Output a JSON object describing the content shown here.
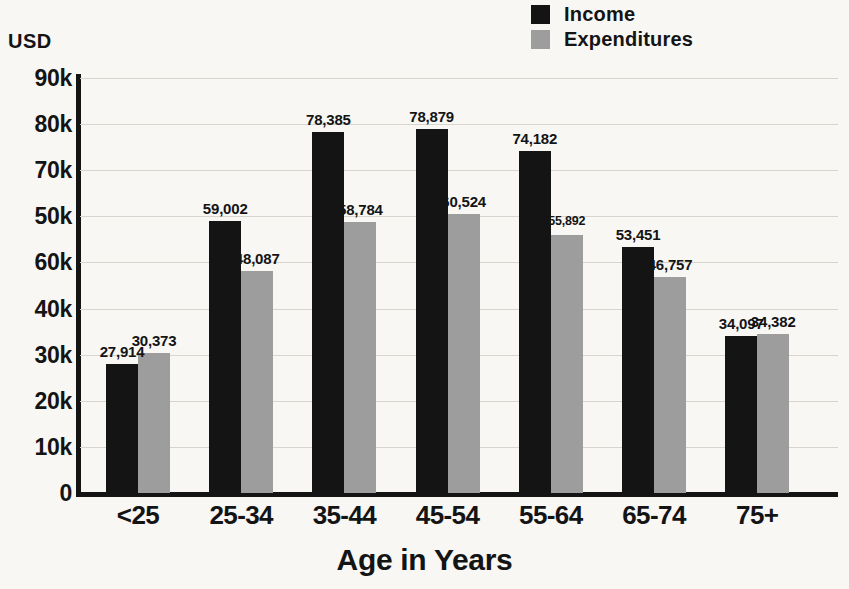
{
  "chart_data": {
    "type": "bar",
    "title": "",
    "xlabel": "Age in Years",
    "ylabel": "USD",
    "categories": [
      "<25",
      "25-34",
      "35-44",
      "45-54",
      "55-64",
      "65-74",
      "75+"
    ],
    "series": [
      {
        "name": "Income",
        "color": "#141414",
        "values": [
          27914,
          59002,
          78385,
          78879,
          74182,
          53451,
          34097
        ],
        "labels": [
          "27,914",
          "59,002",
          "78,385",
          "78,879",
          "74,182",
          "53,451",
          "34,097"
        ]
      },
      {
        "name": "Expenditures",
        "color": "#9d9d9d",
        "values": [
          30373,
          48087,
          58784,
          60524,
          55892,
          46757,
          34382
        ],
        "labels": [
          "30,373",
          "48,087",
          "58,784",
          "60,524",
          "55,892",
          "46,757",
          "34,382"
        ]
      }
    ],
    "ylim": [
      0,
      90000
    ],
    "y_tick_labels": [
      "90k",
      "80k",
      "70k",
      "50k",
      "60k",
      "40k",
      "30k",
      "20k",
      "10k",
      "0"
    ],
    "y_tick_values": [
      90000,
      80000,
      70000,
      60000,
      50000,
      40000,
      30000,
      20000,
      10000,
      0
    ],
    "grid": true,
    "legend_position": "top-right",
    "background_color": "#f8f7f4",
    "gridline_color": "#d8d5cf"
  },
  "legend": {
    "items": [
      {
        "label": "Income",
        "swatch": "income"
      },
      {
        "label": "Expenditures",
        "swatch": "expenditures"
      }
    ]
  },
  "axes": {
    "y_unit_label": "USD",
    "x_title": "Age in Years"
  }
}
